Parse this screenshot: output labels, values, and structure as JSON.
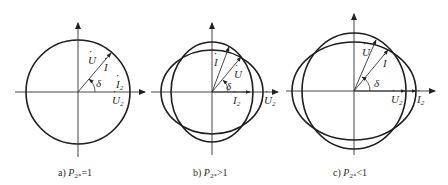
{
  "figure": {
    "panels": [
      {
        "id": "a",
        "caption_prefix": "a)",
        "caption_var": "P",
        "caption_sub": "2*",
        "caption_rel": "=1",
        "labels": {
          "voltage": "U",
          "current": "I",
          "angle": "δ",
          "current2": "I",
          "current2_sub": "2",
          "voltage2": "U",
          "voltage2_sub": "2"
        }
      },
      {
        "id": "b",
        "caption_prefix": "b)",
        "caption_var": "P",
        "caption_sub": "2*",
        "caption_rel": ">1",
        "labels": {
          "voltage": "U",
          "current": "I",
          "angle": "δ",
          "current2": "I",
          "current2_sub": "2",
          "voltage2": "U",
          "voltage2_sub": "2"
        }
      },
      {
        "id": "c",
        "caption_prefix": "c)",
        "caption_var": "P",
        "caption_sub": "2*",
        "caption_rel": "<1",
        "labels": {
          "voltage": "U",
          "current": "I",
          "angle": "δ",
          "current2": "I",
          "current2_sub": "2",
          "voltage2": "U",
          "voltage2_sub": "2"
        }
      }
    ],
    "dot_mark": "·",
    "colors": {
      "line": "#1e1e1e",
      "text": "#2a2a2a",
      "background": "#ffffff"
    }
  }
}
